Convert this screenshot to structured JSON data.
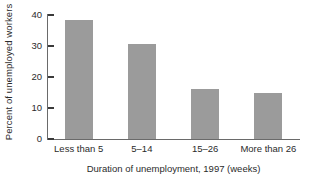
{
  "chart_data": {
    "type": "bar",
    "title": "",
    "xlabel": "Duration of unemployment, 1997 (weeks)",
    "ylabel": "Percent of unemployed workers",
    "categories": [
      "Less than 5",
      "5–14",
      "15–26",
      "More than 26"
    ],
    "values": [
      38.5,
      30.5,
      16.0,
      15.0
    ],
    "ylim": [
      0,
      40
    ],
    "yticks": [
      0,
      10,
      20,
      30,
      40
    ],
    "ytick_labels": [
      "0",
      "10",
      "20",
      "30",
      "40"
    ],
    "grid": false,
    "legend": null,
    "bar_color": "#9b9b9b",
    "axis_color": "#6a6a6a",
    "background": "#ffffff"
  },
  "axis": {
    "y_title": "Percent of unemployed workers",
    "x_title": "Duration of unemployment, 1997 (weeks)"
  }
}
